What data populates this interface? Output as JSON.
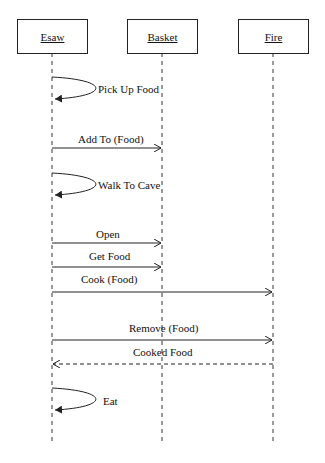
{
  "diagram": {
    "type": "sequence",
    "participants": [
      {
        "name": "Esaw",
        "x": 52
      },
      {
        "name": "Basket",
        "x": 162
      },
      {
        "name": "Fire",
        "x": 273
      }
    ],
    "messages": [
      {
        "label": "Pick Up Food",
        "from": "Esaw",
        "to": "Esaw",
        "kind": "self"
      },
      {
        "label": "Add To (Food)",
        "from": "Esaw",
        "to": "Basket",
        "kind": "sync"
      },
      {
        "label": "Walk To Cave",
        "from": "Esaw",
        "to": "Esaw",
        "kind": "self"
      },
      {
        "label": "Open",
        "from": "Esaw",
        "to": "Basket",
        "kind": "sync"
      },
      {
        "label": "Get Food",
        "from": "Esaw",
        "to": "Basket",
        "kind": "sync"
      },
      {
        "label": "Cook (Food)",
        "from": "Esaw",
        "to": "Fire",
        "kind": "sync"
      },
      {
        "label": "Remove (Food)",
        "from": "Esaw",
        "to": "Fire",
        "kind": "sync"
      },
      {
        "label": "Cooked Food",
        "from": "Fire",
        "to": "Esaw",
        "kind": "return"
      },
      {
        "label": "Eat",
        "from": "Esaw",
        "to": "Esaw",
        "kind": "self"
      }
    ]
  }
}
